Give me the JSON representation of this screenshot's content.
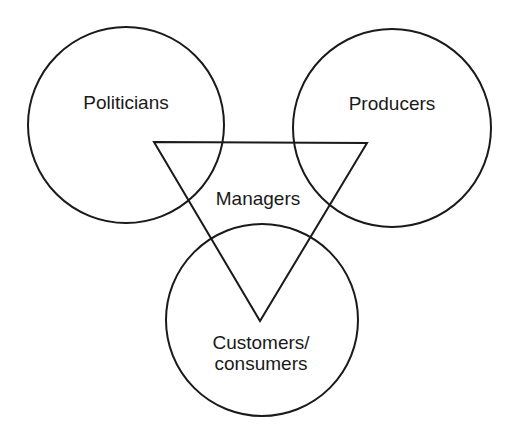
{
  "diagram": {
    "type": "venn-with-triangle",
    "stroke_color": "#1a1a1a",
    "background_color": "#ffffff",
    "nodes": [
      {
        "id": "politicians",
        "label": "Politicians",
        "shape": "circle",
        "position": "top-left"
      },
      {
        "id": "producers",
        "label": "Producers",
        "shape": "circle",
        "position": "top-right"
      },
      {
        "id": "customers",
        "label_line1": "Customers/",
        "label_line2": "consumers",
        "shape": "circle",
        "position": "bottom"
      },
      {
        "id": "managers",
        "label": "Managers",
        "shape": "inverted-triangle",
        "position": "center"
      }
    ]
  }
}
